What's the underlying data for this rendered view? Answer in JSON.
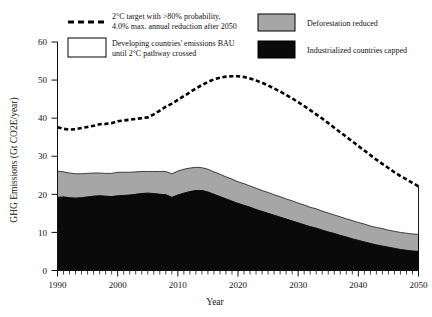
{
  "chart_data": {
    "type": "area",
    "title": "",
    "xlabel": "Year",
    "ylabel": "GHG Emissions (Gt CO2E/year)",
    "xlim": [
      1990,
      2050
    ],
    "ylim": [
      0,
      60
    ],
    "xticks": [
      1990,
      2000,
      2010,
      2020,
      2030,
      2040,
      2050
    ],
    "yticks": [
      0,
      10,
      20,
      30,
      40,
      50,
      60
    ],
    "xtick_labels": [
      "1990",
      "2000",
      "2010",
      "2020",
      "2030",
      "2040",
      "2050"
    ],
    "ytick_labels": [
      "0",
      "10",
      "20",
      "30",
      "40",
      "50",
      "60"
    ],
    "minor_xtick_interval": 1,
    "grid": false,
    "legend_position": "top",
    "stacked": true,
    "x": [
      1990,
      1991,
      1992,
      1993,
      1994,
      1995,
      1996,
      1997,
      1998,
      1999,
      2000,
      2001,
      2002,
      2003,
      2004,
      2005,
      2006,
      2007,
      2008,
      2009,
      2010,
      2011,
      2012,
      2013,
      2014,
      2015,
      2016,
      2017,
      2018,
      2019,
      2020,
      2021,
      2022,
      2023,
      2024,
      2025,
      2026,
      2027,
      2028,
      2029,
      2030,
      2031,
      2032,
      2033,
      2034,
      2035,
      2036,
      2037,
      2038,
      2039,
      2040,
      2041,
      2042,
      2043,
      2044,
      2045,
      2046,
      2047,
      2048,
      2049,
      2050
    ],
    "series": [
      {
        "name": "Industrialized countries capped",
        "color": "#0a0a0a",
        "values": [
          19.2,
          19.3,
          19.1,
          19.0,
          19.1,
          19.3,
          19.5,
          19.6,
          19.5,
          19.4,
          19.6,
          19.7,
          19.8,
          20.0,
          20.2,
          20.3,
          20.2,
          20.0,
          19.9,
          19.2,
          19.8,
          20.3,
          20.7,
          21.0,
          21.0,
          20.6,
          20.0,
          19.4,
          18.8,
          18.2,
          17.6,
          17.1,
          16.6,
          16.0,
          15.5,
          15.0,
          14.5,
          14.0,
          13.5,
          13.0,
          12.5,
          12.0,
          11.5,
          11.1,
          10.6,
          10.1,
          9.7,
          9.2,
          8.8,
          8.3,
          7.9,
          7.5,
          7.1,
          6.7,
          6.4,
          6.1,
          5.8,
          5.5,
          5.3,
          5.1,
          5.0
        ]
      },
      {
        "name": "Deforestation reduced",
        "color": "#a6a6a6",
        "values": [
          6.9,
          6.6,
          6.5,
          6.4,
          6.3,
          6.2,
          6.1,
          6.0,
          6.0,
          6.1,
          6.2,
          6.1,
          6.0,
          5.9,
          5.8,
          5.7,
          5.8,
          6.0,
          6.1,
          6.2,
          6.3,
          6.3,
          6.2,
          6.1,
          6.0,
          6.0,
          5.9,
          5.9,
          5.8,
          5.8,
          5.7,
          5.7,
          5.6,
          5.6,
          5.5,
          5.5,
          5.4,
          5.4,
          5.3,
          5.3,
          5.2,
          5.2,
          5.1,
          5.1,
          5.0,
          5.0,
          4.9,
          4.9,
          4.8,
          4.8,
          4.7,
          4.7,
          4.6,
          4.6,
          4.6,
          4.5,
          4.5,
          4.5,
          4.5,
          4.5,
          4.5
        ]
      }
    ],
    "target_line": {
      "name": "2°C target with >80% probability, 4.0% max. annual reduction after 2050",
      "style": "dashed",
      "color": "#000000",
      "values": [
        37.6,
        37.2,
        37.0,
        37.1,
        37.4,
        37.7,
        38.0,
        38.4,
        38.5,
        38.7,
        39.2,
        39.4,
        39.6,
        39.8,
        40.0,
        40.2,
        41.0,
        42.0,
        43.0,
        43.8,
        44.8,
        45.8,
        46.8,
        47.8,
        48.7,
        49.5,
        50.2,
        50.6,
        50.9,
        51.0,
        51.0,
        50.8,
        50.4,
        49.9,
        49.3,
        48.6,
        47.8,
        47.0,
        46.1,
        45.2,
        44.2,
        43.2,
        42.1,
        41.0,
        39.9,
        38.7,
        37.5,
        36.3,
        35.1,
        33.9,
        32.7,
        31.5,
        30.3,
        29.1,
        28.0,
        26.9,
        25.8,
        24.8,
        23.9,
        23.0,
        22.1
      ]
    }
  },
  "legend": {
    "items": [
      {
        "key": "target",
        "swatch": "dashed-line",
        "line1": "2°C target with >80% probability,",
        "line2": "4.0% max. annual reduction after 2050"
      },
      {
        "key": "bau",
        "swatch": "white-box",
        "line1": "Developing countries' emissions BAU",
        "line2": "until 2°C pathway crossed"
      },
      {
        "key": "deforestation",
        "swatch": "gray-box",
        "line1": "Deforestation reduced",
        "line2": ""
      },
      {
        "key": "industrialized",
        "swatch": "black-box",
        "line1": "Industrialized countries capped",
        "line2": ""
      }
    ]
  },
  "axes": {
    "y_title": "GHG Emissions (Gt CO2E/year)",
    "x_title": "Year"
  }
}
